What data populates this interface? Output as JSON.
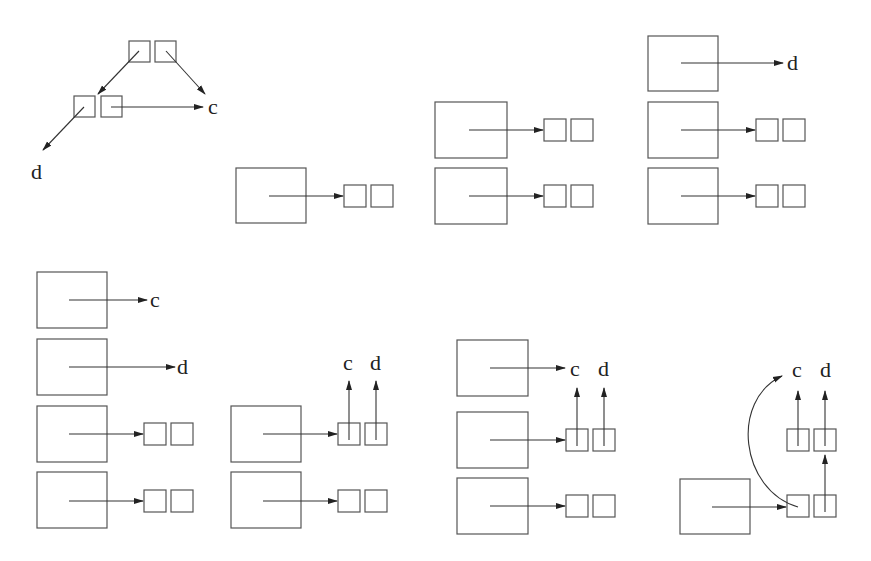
{
  "diagram": {
    "labels": {
      "c": "c",
      "d": "d"
    },
    "panels": [
      {
        "id": 1,
        "name": "tree-structure",
        "labels": [
          "c",
          "d"
        ]
      },
      {
        "id": 2,
        "name": "single-frame",
        "labels": []
      },
      {
        "id": 3,
        "name": "two-frames",
        "labels": []
      },
      {
        "id": 4,
        "name": "three-frames-d",
        "labels": [
          "d"
        ]
      },
      {
        "id": 5,
        "name": "four-frames-c-d",
        "labels": [
          "c",
          "d"
        ]
      },
      {
        "id": 6,
        "name": "two-frames-pair-to-c-d",
        "labels": [
          "c",
          "d"
        ]
      },
      {
        "id": 7,
        "name": "three-frames-c-pair-c-d",
        "labels": [
          "c",
          "d"
        ]
      },
      {
        "id": 8,
        "name": "single-frame-shared-structure",
        "labels": [
          "c",
          "d"
        ]
      }
    ]
  }
}
